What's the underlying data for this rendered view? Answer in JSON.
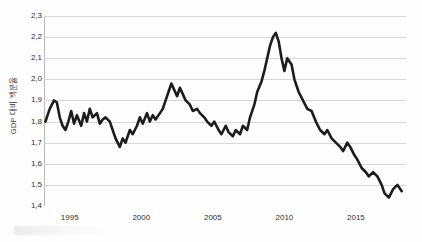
{
  "chart_data": {
    "type": "line",
    "title": "",
    "subtitle": "",
    "xlabel": "",
    "ylabel": "GDP 대비 백분율",
    "xlim": [
      1993.2,
      2018.5
    ],
    "ylim": [
      1.4,
      2.3
    ],
    "grid": true,
    "legend": null,
    "legend_position": "none",
    "decimal_separator": ",",
    "line_color": "#1c1c1c",
    "grid_color": "#d6d6d6",
    "axis_color": "#8f8f8f",
    "background_color": "#fefefe",
    "yticks": [
      "1,4",
      "1,5",
      "1,6",
      "1,7",
      "1,8",
      "1,9",
      "2,0",
      "2,1",
      "2,2",
      "2,3"
    ],
    "ytick_values": [
      1.4,
      1.5,
      1.6,
      1.7,
      1.8,
      1.9,
      2.0,
      2.1,
      2.2,
      2.3
    ],
    "xticks": [
      "1995",
      "2000",
      "2005",
      "2010",
      "2015"
    ],
    "xtick_values": [
      1995,
      2000,
      2005,
      2010,
      2015
    ],
    "series": [
      {
        "name": "GDP 대비 백분율",
        "x": [
          1993.3,
          1993.6,
          1993.9,
          1994.1,
          1994.3,
          1994.5,
          1994.7,
          1994.9,
          1995.1,
          1995.3,
          1995.5,
          1995.8,
          1996.0,
          1996.2,
          1996.4,
          1996.6,
          1996.9,
          1997.1,
          1997.3,
          1997.5,
          1997.8,
          1998.0,
          1998.2,
          1998.5,
          1998.7,
          1998.9,
          1999.2,
          1999.4,
          1999.7,
          1999.9,
          2000.1,
          2000.4,
          2000.6,
          2000.8,
          2001.0,
          2001.3,
          2001.5,
          2001.7,
          2001.9,
          2002.1,
          2002.3,
          2002.5,
          2002.7,
          2002.9,
          2003.1,
          2003.4,
          2003.6,
          2003.9,
          2004.1,
          2004.4,
          2004.6,
          2004.9,
          2005.1,
          2005.4,
          2005.6,
          2005.9,
          2006.1,
          2006.4,
          2006.6,
          2006.9,
          2007.1,
          2007.4,
          2007.6,
          2007.9,
          2008.1,
          2008.4,
          2008.6,
          2008.8,
          2009.0,
          2009.2,
          2009.4,
          2009.6,
          2009.8,
          2010.0,
          2010.2,
          2010.5,
          2010.7,
          2011.0,
          2011.3,
          2011.6,
          2011.9,
          2012.2,
          2012.5,
          2012.8,
          2013.0,
          2013.3,
          2013.6,
          2013.9,
          2014.1,
          2014.4,
          2014.6,
          2014.9,
          2015.1,
          2015.4,
          2015.7,
          2015.9,
          2016.2,
          2016.5,
          2016.8,
          2017.0,
          2017.3,
          2017.6,
          2017.9,
          2018.2
        ],
        "y": [
          1.8,
          1.86,
          1.9,
          1.89,
          1.82,
          1.78,
          1.76,
          1.8,
          1.85,
          1.79,
          1.83,
          1.78,
          1.84,
          1.8,
          1.86,
          1.82,
          1.84,
          1.79,
          1.81,
          1.82,
          1.8,
          1.76,
          1.72,
          1.68,
          1.72,
          1.7,
          1.76,
          1.74,
          1.78,
          1.82,
          1.79,
          1.84,
          1.8,
          1.83,
          1.81,
          1.84,
          1.86,
          1.9,
          1.94,
          1.98,
          1.95,
          1.92,
          1.96,
          1.93,
          1.9,
          1.88,
          1.85,
          1.86,
          1.84,
          1.82,
          1.8,
          1.78,
          1.8,
          1.76,
          1.74,
          1.78,
          1.75,
          1.73,
          1.76,
          1.74,
          1.78,
          1.76,
          1.82,
          1.88,
          1.94,
          1.99,
          2.04,
          2.1,
          2.16,
          2.2,
          2.22,
          2.18,
          2.1,
          2.04,
          2.1,
          2.07,
          2.0,
          1.94,
          1.9,
          1.86,
          1.85,
          1.8,
          1.76,
          1.74,
          1.76,
          1.72,
          1.7,
          1.68,
          1.66,
          1.7,
          1.68,
          1.64,
          1.62,
          1.58,
          1.56,
          1.54,
          1.56,
          1.54,
          1.5,
          1.46,
          1.44,
          1.48,
          1.5,
          1.47
        ]
      }
    ]
  }
}
